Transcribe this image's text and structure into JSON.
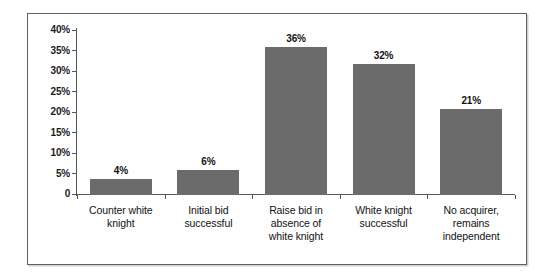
{
  "chart_data": {
    "type": "bar",
    "title": "",
    "xlabel": "",
    "ylabel": "Success Rate",
    "ylim": [
      0,
      40
    ],
    "grid": false,
    "legend": null,
    "bar_color": "#6b6b6b",
    "categories": [
      "Counter white knight",
      "Initial bid successful",
      "Raise bid in absence of white knight",
      "White knight successful",
      "No acquirer, remains independent"
    ],
    "category_lines": [
      [
        "Counter white",
        "knight"
      ],
      [
        "Initial bid",
        "successful"
      ],
      [
        "Raise bid in",
        "absence of",
        "white knight"
      ],
      [
        "White knight",
        "successful"
      ],
      [
        "No acquirer,",
        "remains",
        "independent"
      ]
    ],
    "values": [
      4,
      6,
      36,
      32,
      21
    ],
    "value_labels": [
      "4%",
      "6%",
      "36%",
      "32%",
      "21%"
    ],
    "ytick_labels": [
      "40%",
      "35%",
      "30%",
      "25%",
      "20%",
      "15%",
      "10%",
      "5%",
      "0"
    ],
    "ytick_values": [
      40,
      35,
      30,
      25,
      20,
      15,
      10,
      5,
      0
    ]
  }
}
